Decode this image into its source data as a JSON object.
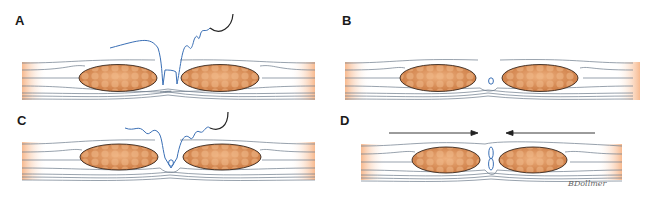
{
  "figure": {
    "panels": [
      {
        "id": "A",
        "label": "A",
        "stage": "suture-passed-through-both-edges"
      },
      {
        "id": "B",
        "label": "B",
        "stage": "knot-tied-at-deep-layer"
      },
      {
        "id": "C",
        "label": "C",
        "stage": "second-suture-passed"
      },
      {
        "id": "D",
        "label": "D",
        "stage": "edges-approximated",
        "arrows": [
          "right",
          "left"
        ]
      }
    ],
    "signature": "BDollmer",
    "colors": {
      "muscle": "#d98a55",
      "muscle_light": "#f2c9a6",
      "fascia_line": "#6b7a8a",
      "suture": "#3a6fb5",
      "needle": "#222222",
      "fade_orange": "#f5b58a"
    }
  }
}
